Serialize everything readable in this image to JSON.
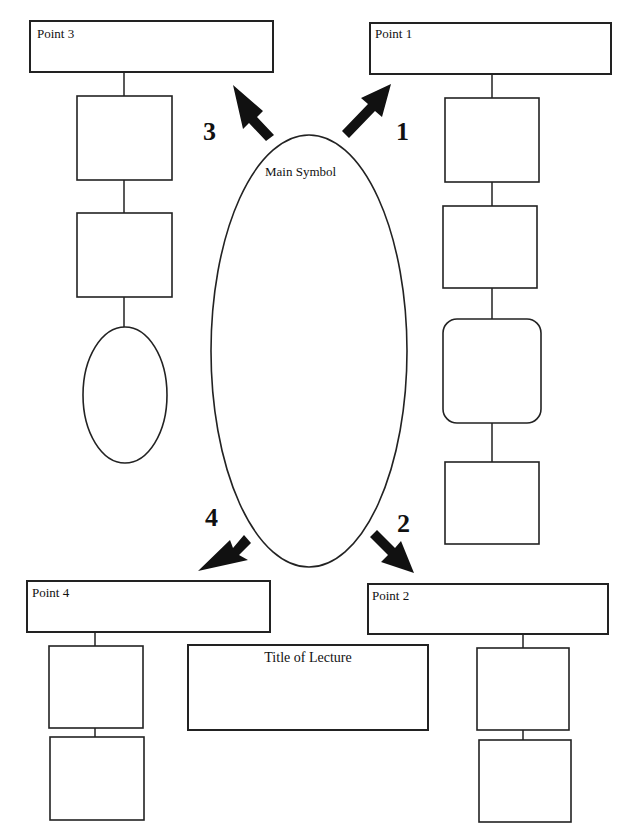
{
  "diagram": {
    "type": "lecture-notes graphic organizer",
    "main_symbol": {
      "label": "Main Symbol"
    },
    "title_box": {
      "label": "Title of Lecture"
    },
    "points": [
      {
        "id": 1,
        "label": "Point 1",
        "number": "1",
        "direction": "up-right",
        "sub_shapes": [
          "rectangle",
          "rectangle",
          "rounded-rectangle",
          "rectangle"
        ]
      },
      {
        "id": 2,
        "label": "Point 2",
        "number": "2",
        "direction": "down-right",
        "sub_shapes": [
          "rectangle",
          "rectangle"
        ]
      },
      {
        "id": 3,
        "label": "Point 3",
        "number": "3",
        "direction": "up-left",
        "sub_shapes": [
          "rectangle",
          "rectangle",
          "ellipse"
        ]
      },
      {
        "id": 4,
        "label": "Point 4",
        "number": "4",
        "direction": "down-left",
        "sub_shapes": [
          "rectangle",
          "rectangle"
        ]
      }
    ],
    "colors": {
      "stroke": "#222222",
      "background": "#ffffff",
      "arrow": "#111111"
    }
  }
}
